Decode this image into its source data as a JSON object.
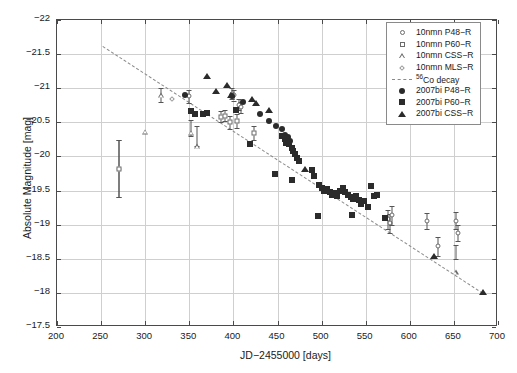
{
  "chart_data": {
    "type": "scatter",
    "title": "",
    "xlabel": "JD−2455000 [days]",
    "ylabel": "Absolute Magnitude [mag]",
    "xlim": [
      200,
      700
    ],
    "ylim": [
      -22,
      -17.5
    ],
    "y_inverted": true,
    "grid": true,
    "xticks": [
      200,
      250,
      300,
      350,
      400,
      450,
      500,
      550,
      600,
      650,
      700
    ],
    "xticklabels": [
      "200",
      "250",
      "300",
      "350",
      "400",
      "450",
      "500",
      "550",
      "600",
      "650",
      "700"
    ],
    "yticks": [
      -22,
      -21.5,
      -21,
      -20.5,
      -20,
      -19.5,
      -19,
      -18.5,
      -18,
      -17.5
    ],
    "yticklabels": [
      "−22",
      "−21.5",
      "−21",
      "−20.5",
      "−20",
      "−19.5",
      "−19",
      "−18.5",
      "−18",
      "−17.5"
    ],
    "legend_position": "top-right",
    "legend_entries": [
      {
        "label": "10nmn P48−R",
        "marker": "circle-open",
        "color": "#6b6b6b"
      },
      {
        "label": "10nmn P60−R",
        "marker": "square-open",
        "color": "#6b6b6b"
      },
      {
        "label": "10nmn CSS−R",
        "marker": "triangle-open",
        "color": "#6b6b6b"
      },
      {
        "label": "10nmn MLS−R",
        "marker": "diamond-open",
        "color": "#9a9a9a"
      },
      {
        "label": "56Co decay",
        "marker": "dashed-line",
        "color": "#8a8a8a"
      },
      {
        "label": "2007bi P48−R",
        "marker": "circle-filled",
        "color": "#2b2b2b"
      },
      {
        "label": "2007bi P60−R",
        "marker": "square-filled",
        "color": "#2b2b2b"
      },
      {
        "label": "2007bi CSS−R",
        "marker": "triangle-filled",
        "color": "#2b2b2b"
      }
    ],
    "decay_line": {
      "x": [
        252,
        683
      ],
      "y": [
        -21.62,
        -18.0
      ],
      "style": "dashed"
    },
    "series": [
      {
        "name": "10nmn P48−R",
        "marker": "circle-open",
        "points": [
          {
            "x": 270,
            "y": -19.82,
            "yerr": 0.42
          },
          {
            "x": 350,
            "y": -20.88,
            "yerr": 0.1
          },
          {
            "x": 398,
            "y": -20.92,
            "yerr": 0.08
          },
          {
            "x": 401,
            "y": -20.9,
            "yerr": 0.08
          },
          {
            "x": 406,
            "y": -20.76,
            "yerr": 0.08
          },
          {
            "x": 409,
            "y": -20.72,
            "yerr": 0.08
          },
          {
            "x": 575,
            "y": -19.08,
            "yerr": 0.14
          },
          {
            "x": 578,
            "y": -19.02,
            "yerr": 0.14
          },
          {
            "x": 580,
            "y": -19.14,
            "yerr": 0.14
          },
          {
            "x": 620,
            "y": -19.05,
            "yerr": 0.12
          },
          {
            "x": 652,
            "y": -19.06,
            "yerr": 0.12
          },
          {
            "x": 655,
            "y": -18.88,
            "yerr": 0.12
          },
          {
            "x": 632,
            "y": -18.68,
            "yerr": 0.14
          }
        ]
      },
      {
        "name": "10nmn P60−R",
        "marker": "square-open",
        "points": [
          {
            "x": 270,
            "y": -19.82,
            "yerr": 0.42
          },
          {
            "x": 396,
            "y": -20.5,
            "yerr": 0.1
          },
          {
            "x": 404,
            "y": -20.52,
            "yerr": 0.1
          },
          {
            "x": 423,
            "y": -20.34,
            "yerr": 0.1
          },
          {
            "x": 386,
            "y": -20.58,
            "yerr": 0.08
          },
          {
            "x": 390,
            "y": -20.6,
            "yerr": 0.08
          }
        ]
      },
      {
        "name": "10nmn CSS−R",
        "marker": "triangle-open",
        "points": [
          {
            "x": 318,
            "y": -20.9,
            "yerr": 0.1
          },
          {
            "x": 352,
            "y": -20.42,
            "yerr": 0.12
          },
          {
            "x": 359,
            "y": -20.3,
            "yerr": 0.14
          },
          {
            "x": 300,
            "y": -20.58,
            "yerr": 0.0
          },
          {
            "x": 652,
            "y": -18.6,
            "yerr": 0.1
          }
        ]
      },
      {
        "name": "10nmn MLS−R",
        "marker": "diamond-open",
        "points": [
          {
            "x": 330,
            "y": -20.84,
            "yerr": 0.0
          },
          {
            "x": 365,
            "y": -20.62,
            "yerr": 0.0
          }
        ]
      },
      {
        "name": "2007bi P48−R",
        "marker": "circle-filled",
        "points": [
          {
            "x": 345,
            "y": -20.9,
            "yerr": 0
          },
          {
            "x": 398,
            "y": -20.88,
            "yerr": 0
          },
          {
            "x": 411,
            "y": -20.8,
            "yerr": 0
          },
          {
            "x": 430,
            "y": -20.62,
            "yerr": 0
          },
          {
            "x": 440,
            "y": -20.52,
            "yerr": 0
          },
          {
            "x": 448,
            "y": -20.44,
            "yerr": 0
          },
          {
            "x": 455,
            "y": -20.4,
            "yerr": 0
          },
          {
            "x": 458,
            "y": -20.32,
            "yerr": 0
          },
          {
            "x": 462,
            "y": -20.28,
            "yerr": 0
          },
          {
            "x": 464,
            "y": -20.22,
            "yerr": 0
          }
        ]
      },
      {
        "name": "2007bi P60−R",
        "marker": "square-filled",
        "points": [
          {
            "x": 352,
            "y": -20.66,
            "yerr": 0
          },
          {
            "x": 356,
            "y": -20.62,
            "yerr": 0
          },
          {
            "x": 365,
            "y": -20.62,
            "yerr": 0
          },
          {
            "x": 370,
            "y": -20.64,
            "yerr": 0
          },
          {
            "x": 403,
            "y": -20.68,
            "yerr": 0
          },
          {
            "x": 419,
            "y": -20.18,
            "yerr": 0
          },
          {
            "x": 455,
            "y": -20.3,
            "yerr": 0
          },
          {
            "x": 458,
            "y": -20.26,
            "yerr": 0
          },
          {
            "x": 460,
            "y": -20.2,
            "yerr": 0
          },
          {
            "x": 463,
            "y": -20.18,
            "yerr": 0
          },
          {
            "x": 466,
            "y": -20.12,
            "yerr": 0
          },
          {
            "x": 468,
            "y": -20.08,
            "yerr": 0
          },
          {
            "x": 470,
            "y": -20.04,
            "yerr": 0
          },
          {
            "x": 472,
            "y": -19.98,
            "yerr": 0
          },
          {
            "x": 474,
            "y": -19.94,
            "yerr": 0
          },
          {
            "x": 447,
            "y": -19.74,
            "yerr": 0
          },
          {
            "x": 467,
            "y": -19.66,
            "yerr": 0
          },
          {
            "x": 489,
            "y": -19.8,
            "yerr": 0
          },
          {
            "x": 491,
            "y": -19.72,
            "yerr": 0
          },
          {
            "x": 497,
            "y": -19.58,
            "yerr": 0
          },
          {
            "x": 500,
            "y": -19.54,
            "yerr": 0
          },
          {
            "x": 503,
            "y": -19.5,
            "yerr": 0
          },
          {
            "x": 506,
            "y": -19.52,
            "yerr": 0
          },
          {
            "x": 509,
            "y": -19.48,
            "yerr": 0
          },
          {
            "x": 512,
            "y": -19.44,
            "yerr": 0
          },
          {
            "x": 515,
            "y": -19.46,
            "yerr": 0
          },
          {
            "x": 518,
            "y": -19.42,
            "yerr": 0
          },
          {
            "x": 521,
            "y": -19.5,
            "yerr": 0
          },
          {
            "x": 524,
            "y": -19.54,
            "yerr": 0
          },
          {
            "x": 527,
            "y": -19.48,
            "yerr": 0
          },
          {
            "x": 530,
            "y": -19.44,
            "yerr": 0
          },
          {
            "x": 533,
            "y": -19.4,
            "yerr": 0
          },
          {
            "x": 536,
            "y": -19.38,
            "yerr": 0
          },
          {
            "x": 539,
            "y": -19.42,
            "yerr": 0
          },
          {
            "x": 542,
            "y": -19.36,
            "yerr": 0
          },
          {
            "x": 545,
            "y": -19.3,
            "yerr": 0
          },
          {
            "x": 548,
            "y": -19.34,
            "yerr": 0
          },
          {
            "x": 553,
            "y": -19.26,
            "yerr": 0
          },
          {
            "x": 556,
            "y": -19.56,
            "yerr": 0
          },
          {
            "x": 559,
            "y": -19.42,
            "yerr": 0
          },
          {
            "x": 563,
            "y": -19.44,
            "yerr": 0
          },
          {
            "x": 572,
            "y": -19.1,
            "yerr": 0
          },
          {
            "x": 496,
            "y": -19.12,
            "yerr": 0
          },
          {
            "x": 534,
            "y": -19.14,
            "yerr": 0
          }
        ]
      },
      {
        "name": "2007bi CSS−R",
        "marker": "triangle-filled",
        "points": [
          {
            "x": 370,
            "y": -21.18,
            "yerr": 0
          },
          {
            "x": 380,
            "y": -20.96,
            "yerr": 0
          },
          {
            "x": 393,
            "y": -21.04,
            "yerr": 0
          },
          {
            "x": 397,
            "y": -20.9,
            "yerr": 0
          },
          {
            "x": 421,
            "y": -20.84,
            "yerr": 0
          },
          {
            "x": 426,
            "y": -20.78,
            "yerr": 0
          },
          {
            "x": 440,
            "y": -20.68,
            "yerr": 0
          },
          {
            "x": 481,
            "y": -19.82,
            "yerr": 0
          },
          {
            "x": 628,
            "y": -18.54,
            "yerr": 0
          },
          {
            "x": 683,
            "y": -18.02,
            "yerr": 0
          }
        ]
      }
    ]
  }
}
